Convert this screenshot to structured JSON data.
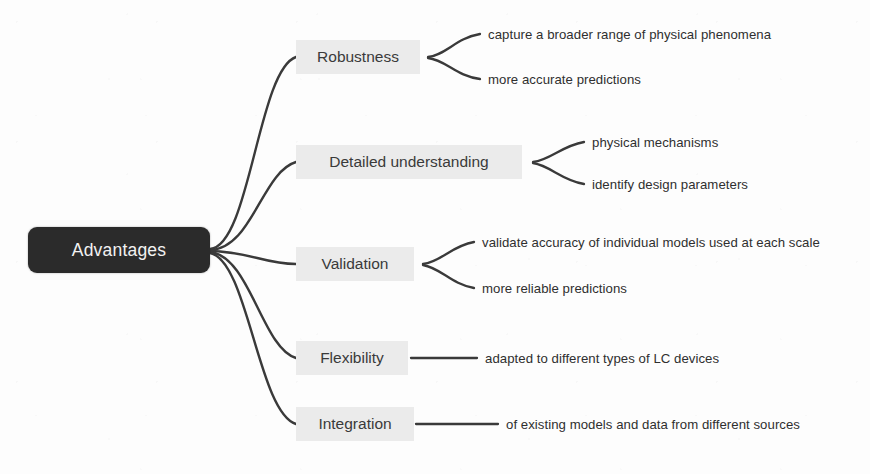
{
  "diagram": {
    "type": "mind-map",
    "title_node": "Advantages",
    "colors": {
      "root_fill": "#2b2b2b",
      "root_text": "#f2f2f2",
      "branch_fill": "#ebebeb",
      "branch_text": "#3a3a3a",
      "leaf_text": "#2f2f2f",
      "edge_stroke": "#3a3a3a",
      "background": "#fdfdfd"
    },
    "branches": [
      {
        "label": "Robustness",
        "leaves": [
          "capture a broader range of physical phenomena",
          "more accurate predictions"
        ]
      },
      {
        "label": "Detailed understanding",
        "leaves": [
          "physical mechanisms",
          "identify design parameters"
        ]
      },
      {
        "label": "Validation",
        "leaves": [
          "validate accuracy of individual models used at each scale",
          "more reliable predictions"
        ]
      },
      {
        "label": "Flexibility",
        "leaves": [
          "adapted to different types of LC devices"
        ]
      },
      {
        "label": "Integration",
        "leaves": [
          "of existing models and data from different sources"
        ]
      }
    ]
  }
}
